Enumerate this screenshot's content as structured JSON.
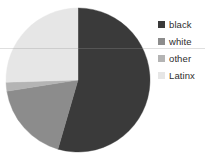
{
  "chart_data": {
    "type": "pie",
    "title": "",
    "subtitle": "",
    "xlabel": "",
    "ylabel": "",
    "grid": false,
    "legend_position": "right",
    "start_angle_deg": 0,
    "direction": "clockwise",
    "categories": [
      "black",
      "white",
      "other",
      "Latinx"
    ],
    "values": [
      54.5,
      18.0,
      2.0,
      25.5
    ],
    "colors": [
      "#3a3a3a",
      "#8c8c8c",
      "#b4b4b4",
      "#e6e6e6"
    ],
    "slices": [
      {
        "label": "black",
        "value": 54.5,
        "color": "#3a3a3a",
        "start_deg": 0.0,
        "end_deg": 196.2
      },
      {
        "label": "white",
        "value": 18.0,
        "color": "#8c8c8c",
        "start_deg": 196.2,
        "end_deg": 261.0
      },
      {
        "label": "other",
        "value": 2.0,
        "color": "#b4b4b4",
        "start_deg": 261.0,
        "end_deg": 268.2
      },
      {
        "label": "Latinx",
        "value": 25.5,
        "color": "#e6e6e6",
        "start_deg": 268.2,
        "end_deg": 360.0
      }
    ]
  },
  "legend": {
    "entries": [
      {
        "label": "black",
        "color": "#3a3a3a"
      },
      {
        "label": "white",
        "color": "#8c8c8c"
      },
      {
        "label": "other",
        "color": "#b4b4b4"
      },
      {
        "label": "Latinx",
        "color": "#e6e6e6"
      }
    ]
  }
}
